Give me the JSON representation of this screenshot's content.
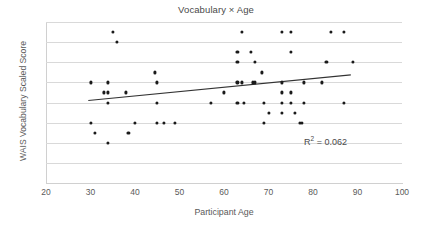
{
  "chart_data": {
    "type": "scatter",
    "title": "Vocabulary × Age",
    "xlabel": "Participant Age",
    "ylabel": "WAIS Vocabulary Scaled Score",
    "xlim": [
      20,
      100
    ],
    "ylim": [
      4,
      20
    ],
    "xticks": [
      20,
      30,
      40,
      50,
      60,
      70,
      80,
      90,
      100
    ],
    "yticks": [
      4,
      6,
      8,
      10,
      12,
      14,
      16,
      18,
      20
    ],
    "grid": "horizontal",
    "legend": "none",
    "annotations": [
      {
        "name": "r-squared",
        "text": "R² = 0.062",
        "prefix": "R",
        "superscript": "2",
        "suffix": " = 0.062",
        "x": 78,
        "y": 8.8
      }
    ],
    "trendline": {
      "type": "linear",
      "x_start": 29.5,
      "y_start": 12.2,
      "x_end": 88.5,
      "y_end": 14.75,
      "color": "#333333"
    },
    "marker": {
      "shape": "circle",
      "color": "#1a1a1a",
      "size": 3.2
    },
    "points": [
      [
        30,
        14
      ],
      [
        30,
        10
      ],
      [
        31,
        9
      ],
      [
        33,
        13
      ],
      [
        34,
        13
      ],
      [
        34,
        14
      ],
      [
        34,
        12
      ],
      [
        34,
        8
      ],
      [
        35,
        19
      ],
      [
        36,
        18
      ],
      [
        38,
        13
      ],
      [
        38.5,
        9
      ],
      [
        40,
        10
      ],
      [
        44.5,
        15
      ],
      [
        45,
        14
      ],
      [
        45,
        12
      ],
      [
        45,
        10
      ],
      [
        46.5,
        10
      ],
      [
        49,
        10
      ],
      [
        57,
        12
      ],
      [
        60,
        13
      ],
      [
        63,
        17
      ],
      [
        63,
        16
      ],
      [
        63,
        14
      ],
      [
        63,
        12
      ],
      [
        64,
        19
      ],
      [
        64,
        14
      ],
      [
        64.5,
        12
      ],
      [
        66,
        17
      ],
      [
        66.5,
        14
      ],
      [
        67,
        16
      ],
      [
        67,
        14
      ],
      [
        68.5,
        15
      ],
      [
        69,
        12
      ],
      [
        69,
        10
      ],
      [
        70,
        11
      ],
      [
        73,
        19
      ],
      [
        73,
        14
      ],
      [
        73,
        13
      ],
      [
        73,
        12
      ],
      [
        73,
        11
      ],
      [
        75,
        19
      ],
      [
        75,
        17
      ],
      [
        75,
        13
      ],
      [
        75,
        12
      ],
      [
        76,
        11
      ],
      [
        77,
        10
      ],
      [
        77.5,
        10
      ],
      [
        78,
        14
      ],
      [
        78,
        12
      ],
      [
        82,
        14
      ],
      [
        83,
        16
      ],
      [
        84,
        19
      ],
      [
        87,
        19
      ],
      [
        87,
        12
      ],
      [
        89,
        16
      ]
    ]
  }
}
